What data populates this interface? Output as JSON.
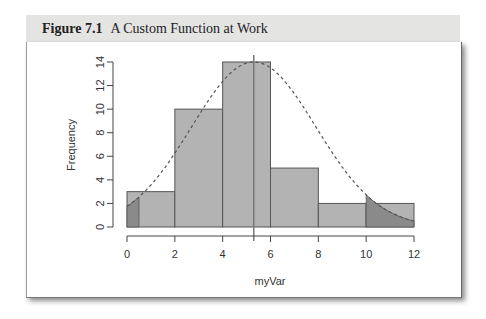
{
  "figure": {
    "number_label": "Figure 7.1",
    "caption": "A Custom Function at Work"
  },
  "chart_data": {
    "type": "bar",
    "subtype": "histogram",
    "title": "",
    "xlabel": "myVar",
    "ylabel": "Frequency",
    "bins": [
      [
        0,
        2
      ],
      [
        2,
        4
      ],
      [
        4,
        6
      ],
      [
        6,
        8
      ],
      [
        8,
        10
      ],
      [
        10,
        12
      ]
    ],
    "categories": [
      "0-2",
      "2-4",
      "4-6",
      "6-8",
      "8-10",
      "10-12"
    ],
    "values": [
      3,
      10,
      14,
      5,
      2,
      2
    ],
    "xlim": [
      0,
      12
    ],
    "ylim": [
      0,
      14
    ],
    "x_ticks": [
      "0",
      "2",
      "4",
      "6",
      "8",
      "10",
      "12"
    ],
    "y_ticks": [
      "0",
      "2",
      "4",
      "6",
      "8",
      "10",
      "12",
      "14"
    ],
    "overlay": {
      "type": "normal-density-curve",
      "style": "dashed",
      "mean": 5.3,
      "sd": 2.6,
      "peak_frequency": 14
    },
    "mean_line": {
      "x": 5.3,
      "style": "solid vertical"
    },
    "shaded_tails": [
      {
        "from": 0,
        "to": 0.5
      },
      {
        "from": 10,
        "to": 12
      }
    ],
    "grid": false,
    "legend": "none",
    "colors": {
      "bar_fill": "#b3b3b3",
      "bar_edge": "#555555",
      "tail_fill": "#8a8a8a",
      "curve": "#555555"
    }
  }
}
